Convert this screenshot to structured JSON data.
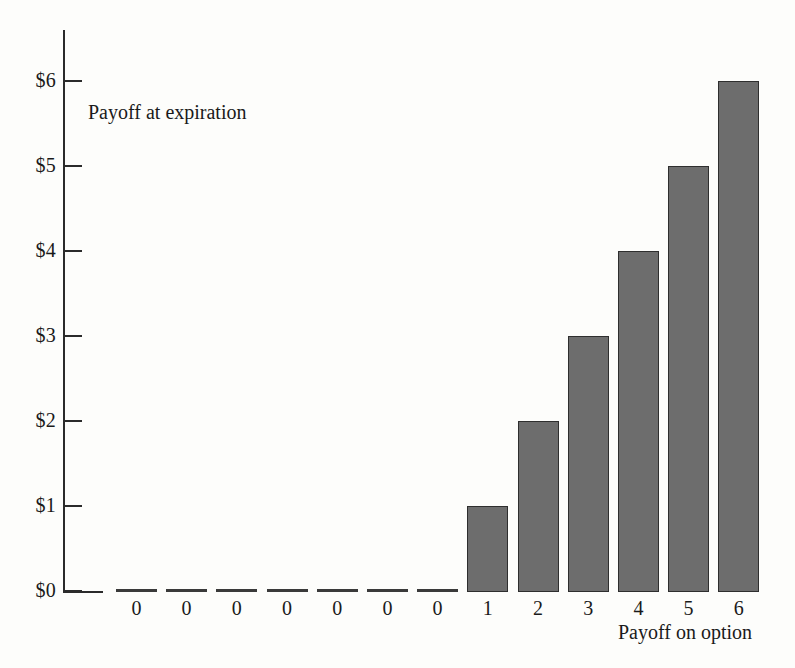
{
  "chart_data": {
    "type": "bar",
    "title": "",
    "xlabel": "Payoff on option",
    "ylabel": "Payoff at expiration",
    "categories": [
      "0",
      "0",
      "0",
      "0",
      "0",
      "0",
      "0",
      "1",
      "2",
      "3",
      "4",
      "5",
      "6"
    ],
    "values": [
      0,
      0,
      0,
      0,
      0,
      0,
      0,
      1,
      2,
      3,
      4,
      5,
      6
    ],
    "ylim": [
      0,
      6
    ],
    "ytick_values": [
      0,
      1,
      2,
      3,
      4,
      5,
      6
    ],
    "ytick_labels": [
      "$0",
      "$1",
      "$2",
      "$3",
      "$4",
      "$5",
      "$6"
    ],
    "grid": false,
    "legend": false,
    "bar_color": "#6d6d6d",
    "bar_edge_color": "#2e2e2e",
    "axis_color": "#2b2b2b",
    "background_color": "#fdfdfb"
  },
  "figure": {
    "y_axis_title": "Payoff at expiration",
    "x_axis_title": "Payoff on option"
  }
}
